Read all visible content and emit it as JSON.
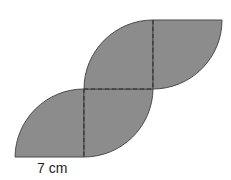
{
  "diagram": {
    "type": "composite-shape-quarter-circles",
    "fill_color": "#8c8c8c",
    "stroke_color": "#4a4a4a",
    "dashed_line_color": "#2e2e2e",
    "pieces": 4,
    "dimension_label": "7 cm"
  }
}
